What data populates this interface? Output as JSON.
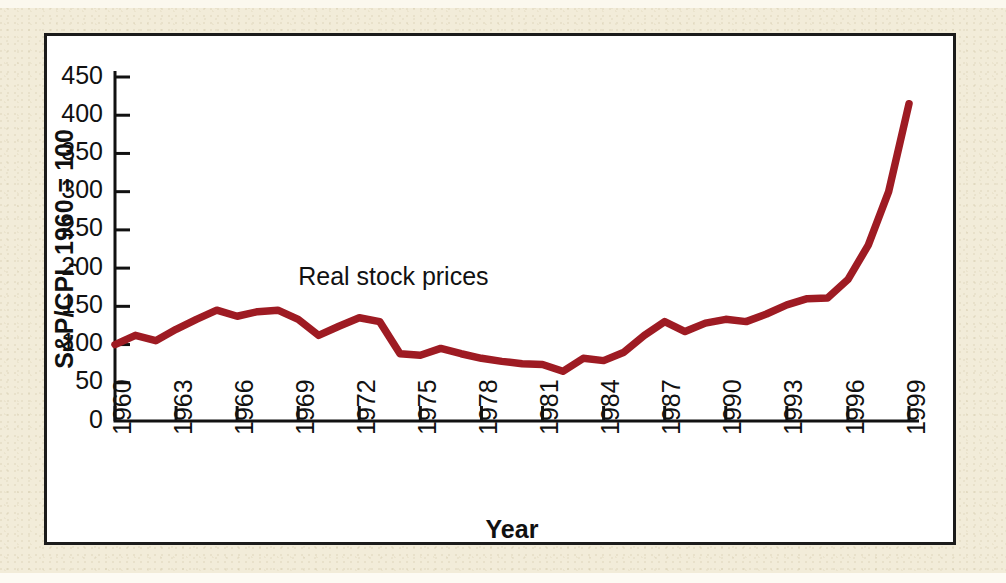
{
  "figure": {
    "background_color": "#f2ecd9",
    "panel_color": "#ffffff",
    "panel_border_color": "#1b1b1b"
  },
  "chart_data": {
    "type": "line",
    "title": "",
    "xlabel": "Year",
    "ylabel": "S&P/CPI, 1960 = 100",
    "xlim": [
      1960,
      1999
    ],
    "ylim": [
      0,
      450
    ],
    "grid": false,
    "legend_position": "inline-annotation",
    "xticks": [
      "1960",
      "1963",
      "1966",
      "1969",
      "1972",
      "1975",
      "1978",
      "1981",
      "1984",
      "1987",
      "1990",
      "1993",
      "1996",
      "1999"
    ],
    "xtick_values": [
      1960,
      1963,
      1966,
      1969,
      1972,
      1975,
      1978,
      1981,
      1984,
      1987,
      1990,
      1993,
      1996,
      1999
    ],
    "yticks": [
      "0",
      "50",
      "100",
      "150",
      "200",
      "250",
      "300",
      "350",
      "400",
      "450"
    ],
    "ytick_values": [
      0,
      50,
      100,
      150,
      200,
      250,
      300,
      350,
      400,
      450
    ],
    "series": [
      {
        "name": "Real stock prices",
        "color": "#9e1b23",
        "annotation": "Real stock prices",
        "annotation_x": 1969.0,
        "annotation_y": 178,
        "x": [
          1960,
          1961,
          1962,
          1963,
          1964,
          1965,
          1966,
          1967,
          1968,
          1969,
          1970,
          1971,
          1972,
          1973,
          1974,
          1975,
          1976,
          1977,
          1978,
          1979,
          1980,
          1981,
          1982,
          1983,
          1984,
          1985,
          1986,
          1987,
          1988,
          1989,
          1990,
          1991,
          1992,
          1993,
          1994,
          1995,
          1996,
          1997,
          1998,
          1999
        ],
        "y": [
          100,
          112,
          105,
          120,
          133,
          145,
          137,
          143,
          145,
          133,
          112,
          124,
          135,
          130,
          88,
          86,
          95,
          88,
          82,
          78,
          75,
          74,
          65,
          82,
          79,
          90,
          112,
          130,
          117,
          128,
          133,
          130,
          140,
          152,
          160,
          161,
          185,
          230,
          300,
          415
        ]
      }
    ]
  }
}
